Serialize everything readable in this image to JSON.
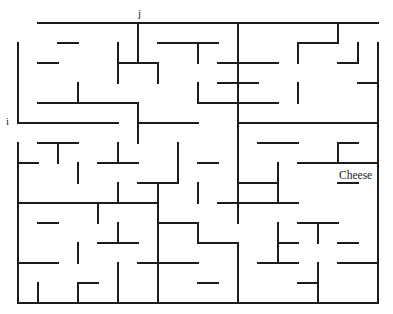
{
  "canvas": {
    "width": 393,
    "height": 314,
    "background": "#ffffff"
  },
  "maze": {
    "origin_x": 18,
    "origin_y": 23,
    "cell": 20,
    "cols": 18,
    "rows": 14,
    "wall_color": "#1c1c1c",
    "wall_thickness": 2,
    "start_label": "i",
    "start_side": "left",
    "start_row": 5,
    "entry_top_label": "j",
    "entry_top_col": 6,
    "goal_label": "Cheese",
    "goal_col": 17,
    "goal_row": 7,
    "horizontal_walls": [
      [
        0,
        1
      ],
      [
        0,
        2
      ],
      [
        0,
        3
      ],
      [
        0,
        4
      ],
      [
        0,
        5
      ],
      [
        0,
        6
      ],
      [
        0,
        7
      ],
      [
        0,
        8
      ],
      [
        0,
        9
      ],
      [
        0,
        10
      ],
      [
        0,
        11
      ],
      [
        0,
        12
      ],
      [
        0,
        13
      ],
      [
        0,
        14
      ],
      [
        0,
        15
      ],
      [
        0,
        16
      ],
      [
        0,
        17
      ],
      [
        1,
        2
      ],
      [
        1,
        7
      ],
      [
        1,
        8
      ],
      [
        1,
        9
      ],
      [
        1,
        14
      ],
      [
        1,
        15
      ],
      [
        2,
        1
      ],
      [
        2,
        5
      ],
      [
        2,
        6
      ],
      [
        2,
        10
      ],
      [
        2,
        11
      ],
      [
        2,
        12
      ],
      [
        2,
        16
      ],
      [
        3,
        10
      ],
      [
        3,
        11
      ],
      [
        3,
        17
      ],
      [
        4,
        1
      ],
      [
        4,
        2
      ],
      [
        4,
        3
      ],
      [
        4,
        4
      ],
      [
        4,
        5
      ],
      [
        4,
        9
      ],
      [
        4,
        10
      ],
      [
        4,
        11
      ],
      [
        4,
        12
      ],
      [
        5,
        0
      ],
      [
        5,
        1
      ],
      [
        5,
        2
      ],
      [
        5,
        3
      ],
      [
        5,
        4
      ],
      [
        5,
        6
      ],
      [
        5,
        7
      ],
      [
        5,
        8
      ],
      [
        5,
        11
      ],
      [
        5,
        12
      ],
      [
        5,
        13
      ],
      [
        5,
        14
      ],
      [
        5,
        15
      ],
      [
        5,
        16
      ],
      [
        5,
        17
      ],
      [
        6,
        1
      ],
      [
        6,
        2
      ],
      [
        6,
        12
      ],
      [
        6,
        13
      ],
      [
        6,
        16
      ],
      [
        7,
        0
      ],
      [
        7,
        4
      ],
      [
        7,
        5
      ],
      [
        7,
        9
      ],
      [
        7,
        14
      ],
      [
        7,
        15
      ],
      [
        7,
        16
      ],
      [
        7,
        17
      ],
      [
        8,
        6
      ],
      [
        8,
        7
      ],
      [
        8,
        11
      ],
      [
        8,
        12
      ],
      [
        8,
        16
      ],
      [
        9,
        0
      ],
      [
        9,
        1
      ],
      [
        9,
        2
      ],
      [
        9,
        3
      ],
      [
        9,
        4
      ],
      [
        9,
        5
      ],
      [
        9,
        6
      ],
      [
        9,
        10
      ],
      [
        9,
        11
      ],
      [
        9,
        12
      ],
      [
        9,
        13
      ],
      [
        10,
        1
      ],
      [
        10,
        7
      ],
      [
        10,
        8
      ],
      [
        10,
        14
      ],
      [
        10,
        15
      ],
      [
        11,
        4
      ],
      [
        11,
        5
      ],
      [
        11,
        9
      ],
      [
        11,
        10
      ],
      [
        11,
        13
      ],
      [
        11,
        16
      ],
      [
        12,
        0
      ],
      [
        12,
        1
      ],
      [
        12,
        6
      ],
      [
        12,
        7
      ],
      [
        12,
        8
      ],
      [
        12,
        12
      ],
      [
        12,
        13
      ],
      [
        12,
        16
      ],
      [
        12,
        17
      ],
      [
        13,
        3
      ],
      [
        13,
        9
      ],
      [
        13,
        14
      ],
      [
        14,
        0
      ],
      [
        14,
        1
      ],
      [
        14,
        2
      ],
      [
        14,
        3
      ],
      [
        14,
        4
      ],
      [
        14,
        5
      ],
      [
        14,
        6
      ],
      [
        14,
        7
      ],
      [
        14,
        8
      ],
      [
        14,
        9
      ],
      [
        14,
        10
      ],
      [
        14,
        11
      ],
      [
        14,
        12
      ],
      [
        14,
        13
      ],
      [
        14,
        14
      ],
      [
        14,
        15
      ],
      [
        14,
        16
      ],
      [
        14,
        17
      ]
    ],
    "vertical_walls": [
      [
        0,
        6
      ],
      [
        0,
        11
      ],
      [
        0,
        16
      ],
      [
        1,
        0
      ],
      [
        1,
        5
      ],
      [
        1,
        6
      ],
      [
        1,
        9
      ],
      [
        1,
        11
      ],
      [
        1,
        14
      ],
      [
        1,
        17
      ],
      [
        1,
        18
      ],
      [
        2,
        0
      ],
      [
        2,
        5
      ],
      [
        2,
        7
      ],
      [
        2,
        11
      ],
      [
        2,
        18
      ],
      [
        3,
        0
      ],
      [
        3,
        3
      ],
      [
        3,
        9
      ],
      [
        3,
        11
      ],
      [
        3,
        14
      ],
      [
        3,
        18
      ],
      [
        4,
        0
      ],
      [
        4,
        6
      ],
      [
        4,
        11
      ],
      [
        4,
        18
      ],
      [
        5,
        6
      ],
      [
        5,
        11
      ],
      [
        5,
        18
      ],
      [
        6,
        0
      ],
      [
        6,
        2
      ],
      [
        6,
        5
      ],
      [
        6,
        8
      ],
      [
        6,
        11
      ],
      [
        6,
        16
      ],
      [
        6,
        18
      ],
      [
        7,
        0
      ],
      [
        7,
        3
      ],
      [
        7,
        8
      ],
      [
        7,
        11
      ],
      [
        7,
        13
      ],
      [
        7,
        18
      ],
      [
        8,
        0
      ],
      [
        8,
        5
      ],
      [
        8,
        7
      ],
      [
        8,
        9
      ],
      [
        8,
        11
      ],
      [
        8,
        13
      ],
      [
        8,
        18
      ],
      [
        9,
        0
      ],
      [
        9,
        4
      ],
      [
        9,
        7
      ],
      [
        9,
        11
      ],
      [
        9,
        18
      ],
      [
        10,
        0
      ],
      [
        10,
        5
      ],
      [
        10,
        7
      ],
      [
        10,
        9
      ],
      [
        10,
        13
      ],
      [
        10,
        15
      ],
      [
        10,
        18
      ],
      [
        11,
        0
      ],
      [
        11,
        3
      ],
      [
        11,
        7
      ],
      [
        11,
        11
      ],
      [
        11,
        13
      ],
      [
        11,
        18
      ],
      [
        12,
        0
      ],
      [
        12,
        5
      ],
      [
        12,
        7
      ],
      [
        12,
        11
      ],
      [
        12,
        15
      ],
      [
        12,
        18
      ],
      [
        13,
        0
      ],
      [
        13,
        1
      ],
      [
        13,
        3
      ],
      [
        13,
        5
      ],
      [
        13,
        7
      ],
      [
        13,
        11
      ],
      [
        13,
        15
      ],
      [
        13,
        18
      ]
    ]
  },
  "labels": {
    "start": "i",
    "top_entry": "j",
    "goal": "Cheese"
  }
}
